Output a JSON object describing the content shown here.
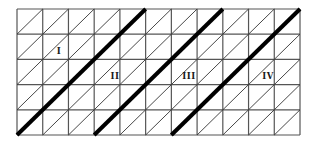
{
  "diagram": {
    "grid": {
      "columns": 11,
      "rows": 5,
      "left": 17,
      "top": 9,
      "right": 300,
      "bottom": 135,
      "line_color": "#555555",
      "diagonal_color": "#333333",
      "thick_color": "#000000"
    },
    "thick_diagonals": [
      {
        "start_col": 0,
        "end_col": 5
      },
      {
        "start_col": 3,
        "end_col": 8
      },
      {
        "start_col": 6,
        "end_col": 11
      }
    ],
    "labels": [
      {
        "text": "I",
        "x": 59,
        "y": 54
      },
      {
        "text": "II",
        "x": 115,
        "y": 79
      },
      {
        "text": "III",
        "x": 189,
        "y": 79
      },
      {
        "text": "IV",
        "x": 268,
        "y": 79
      }
    ]
  }
}
